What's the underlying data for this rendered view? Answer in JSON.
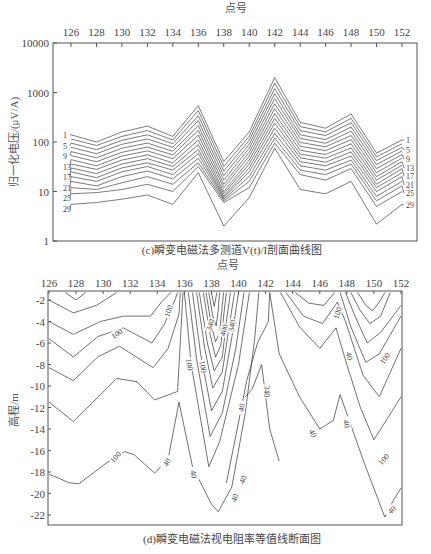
{
  "chart_data": [
    {
      "type": "line",
      "title": "(c)瞬变电磁法多测道V(t)/I剖面曲线图",
      "xlabel": "点号",
      "ylabel": "归一化电压/(μV/A)",
      "xaxis_position": "top",
      "yscale": "log",
      "ylim": [
        1,
        10000
      ],
      "xlim": [
        125,
        153
      ],
      "x_ticks": [
        "126",
        "128",
        "130",
        "132",
        "134",
        "136",
        "138",
        "140",
        "142",
        "144",
        "146",
        "148",
        "150",
        "152"
      ],
      "y_ticks": [
        "1",
        "10",
        "100",
        "1000",
        "10000"
      ],
      "grid": false,
      "x": [
        126,
        128,
        130,
        132,
        134,
        136,
        138,
        140,
        142,
        144,
        146,
        148,
        150,
        152
      ],
      "series_labels_left": [
        "1",
        "5",
        "9",
        "13",
        "17",
        "21",
        "25",
        "29"
      ],
      "series_labels_right": [
        "1",
        "5",
        "9",
        "13",
        "17",
        "21",
        "25",
        "29"
      ],
      "series": [
        {
          "name": "1",
          "values": [
            140,
            100,
            160,
            210,
            130,
            540,
            40,
            160,
            2000,
            250,
            190,
            370,
            60,
            110
          ]
        },
        {
          "name": "3",
          "values": [
            115,
            85,
            130,
            170,
            110,
            430,
            32,
            130,
            1550,
            205,
            160,
            300,
            50,
            92
          ]
        },
        {
          "name": "5",
          "values": [
            95,
            70,
            108,
            140,
            92,
            340,
            26,
            108,
            1200,
            170,
            135,
            245,
            42,
            78
          ]
        },
        {
          "name": "7",
          "values": [
            78,
            58,
            90,
            115,
            78,
            270,
            21,
            90,
            950,
            140,
            112,
            200,
            35,
            66
          ]
        },
        {
          "name": "9",
          "values": [
            64,
            48,
            75,
            95,
            65,
            215,
            17,
            75,
            750,
            118,
            94,
            165,
            29,
            56
          ]
        },
        {
          "name": "11",
          "values": [
            53,
            40,
            62,
            79,
            55,
            172,
            14,
            62,
            590,
            98,
            80,
            135,
            24,
            47
          ]
        },
        {
          "name": "13",
          "values": [
            44,
            33,
            52,
            66,
            46,
            138,
            12,
            52,
            470,
            82,
            67,
            112,
            20,
            40
          ]
        },
        {
          "name": "15",
          "values": [
            36,
            28,
            43,
            55,
            38,
            110,
            10,
            43,
            375,
            68,
            56,
            92,
            17,
            34
          ]
        },
        {
          "name": "17",
          "values": [
            30,
            23,
            36,
            46,
            32,
            88,
            9,
            36,
            300,
            57,
            47,
            76,
            14,
            29
          ]
        },
        {
          "name": "19",
          "values": [
            25,
            19,
            30,
            38,
            27,
            71,
            8,
            30,
            240,
            48,
            39,
            63,
            12,
            24
          ]
        },
        {
          "name": "21",
          "values": [
            20,
            16,
            25,
            32,
            22,
            58,
            7.5,
            25,
            190,
            40,
            33,
            52,
            10,
            20
          ]
        },
        {
          "name": "23",
          "values": [
            16,
            13,
            20,
            26,
            18,
            47,
            7,
            20,
            150,
            33,
            27,
            43,
            8,
            16
          ]
        },
        {
          "name": "25",
          "values": [
            12,
            11,
            15,
            20,
            14,
            38,
            6.5,
            16,
            120,
            27,
            22,
            36,
            6.5,
            13
          ]
        },
        {
          "name": "27",
          "values": [
            9,
            9.5,
            11,
            14,
            10,
            32,
            6,
            12,
            95,
            22,
            17,
            29,
            5,
            10
          ]
        },
        {
          "name": "29",
          "values": [
            5.5,
            6,
            7,
            8.5,
            5.5,
            24,
            2,
            7.5,
            75,
            11,
            9,
            16,
            2.2,
            5.5
          ]
        }
      ]
    },
    {
      "type": "contour",
      "title": "(d)瞬变电磁法视电阻率等值线断面图",
      "xlabel": "点号",
      "ylabel": "高程/m",
      "xaxis_position": "top",
      "xlim": [
        126,
        152
      ],
      "ylim": [
        -23,
        -1.3
      ],
      "x_ticks": [
        "126",
        "128",
        "130",
        "132",
        "134",
        "136",
        "138",
        "140",
        "142",
        "144",
        "146",
        "148",
        "150",
        "152"
      ],
      "y_ticks": [
        "-2",
        "-4",
        "-6",
        "-8",
        "-10",
        "-12",
        "-14",
        "-16",
        "-18",
        "-20",
        "-22"
      ],
      "grid": false,
      "contour_labels": [
        "100",
        "100",
        "100",
        "100",
        "340",
        "400",
        "340",
        "100",
        "40",
        "100",
        "100",
        "340",
        "100",
        "40",
        "40",
        "40",
        "40",
        "40",
        "40",
        "40",
        "40"
      ],
      "contour_levels": [
        40,
        100,
        340,
        400
      ]
    }
  ]
}
